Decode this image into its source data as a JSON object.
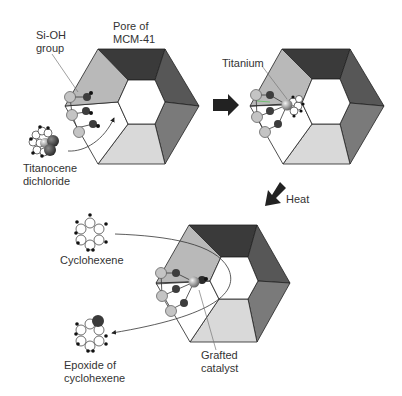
{
  "labels": {
    "sioh_line1": "Si-OH",
    "sioh_line2": "group",
    "pore_line1": "Pore of",
    "pore_line2": "MCM-41",
    "titanocene_line1": "Titanocene",
    "titanocene_line2": "dichloride",
    "titanium": "Titanium",
    "heat": "Heat",
    "cyclohexene": "Cyclohexene",
    "epoxide_line1": "Epoxide of",
    "epoxide_line2": "cyclohexene",
    "grafted_line1": "Grafted",
    "grafted_line2": "catalyst"
  },
  "colors": {
    "face_top": "#3a3a3a",
    "face_upper_right": "#575757",
    "face_lower_right": "#7a7a7a",
    "face_bottom": "#d9d9d9",
    "face_lower_left": "#ffffff",
    "face_upper_left": "#b9b9b9",
    "silicon_atom": "#c4c4c4",
    "oxygen_atom": "#3d3d3d",
    "titanium_atom": "#a8a8a8"
  }
}
